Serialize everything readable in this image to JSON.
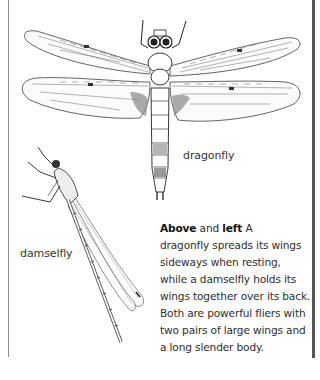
{
  "illustrations": {
    "dragonfly": {
      "label": "dragonfly",
      "icon": "dragonfly-illustration"
    },
    "damselfly": {
      "label": "damselfly",
      "icon": "damselfly-illustration"
    }
  },
  "caption": {
    "bold_1": "Above",
    "text_1": " and ",
    "bold_2": "left",
    "text_2": " A",
    "lines": [
      "dragonfly spreads its wings",
      "sideways when resting,",
      "while a damselfly holds its",
      "wings together over its back.",
      "Both are powerful fliers with",
      "two pairs of large wings and",
      "a long slender body."
    ]
  },
  "colors": {
    "ink": "#2a2a2a",
    "border_right": "#555555",
    "border_left": "#8a8a8a",
    "background": "#ffffff"
  }
}
